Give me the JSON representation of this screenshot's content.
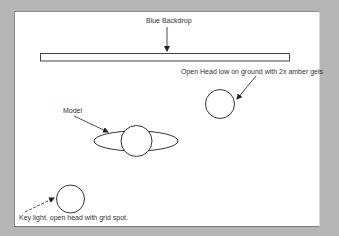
{
  "diagram": {
    "type": "lighting-setup",
    "background_color": "#b5b5b5",
    "panel_color": "#ffffff",
    "stroke_color": "#333333",
    "labels": {
      "backdrop": "Blue Backdrop",
      "open_head": "Open Head low on ground with 2x amber gels",
      "model": "Model",
      "key_light": "Key light, open head with grid spot."
    },
    "elements": [
      {
        "id": "backdrop",
        "shape": "rectangle",
        "label": "Blue Backdrop"
      },
      {
        "id": "open-head-light",
        "shape": "circle",
        "label": "Open Head low on ground with 2x amber gels"
      },
      {
        "id": "model",
        "shape": "circle-with-ellipse",
        "label": "Model"
      },
      {
        "id": "key-light",
        "shape": "circle",
        "label": "Key light, open head with grid spot."
      }
    ]
  }
}
